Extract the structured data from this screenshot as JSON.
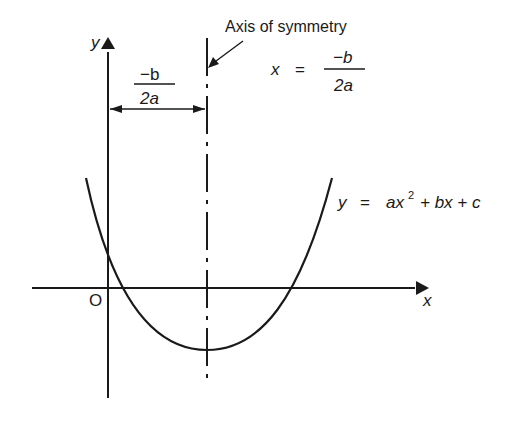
{
  "diagram": {
    "type": "parabola-axis-of-symmetry",
    "axes": {
      "x_label": "x",
      "y_label": "y",
      "origin_label": "O"
    },
    "axis_of_symmetry": {
      "label": "Axis of symmetry",
      "equation_lhs": "x",
      "equation_eq": "=",
      "equation_num": "−b",
      "equation_den": "2a"
    },
    "distance_marker": {
      "num": "−b",
      "den": "2a"
    },
    "curve": {
      "lhs": "y",
      "eq": "=",
      "term1": "ax",
      "term1_sup": "2",
      "term2": "+ bx + c"
    }
  }
}
